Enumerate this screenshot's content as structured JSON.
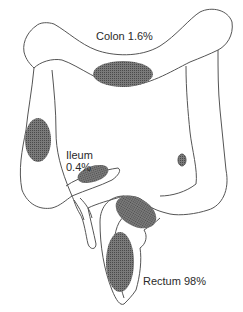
{
  "diagram": {
    "type": "anatomical-illustration",
    "labels": {
      "colon": "Colon  1.6%",
      "ileum_name": "Ileum",
      "ileum_pct": "0.4%",
      "rectum": "Rectum  98%"
    },
    "regions": [
      {
        "name": "Colon",
        "percent": 1.6
      },
      {
        "name": "Ileum",
        "percent": 0.4
      },
      {
        "name": "Rectum",
        "percent": 98
      }
    ],
    "colors": {
      "outline": "#555555",
      "lesion": "#6a6a6a",
      "background": "#ffffff"
    }
  }
}
